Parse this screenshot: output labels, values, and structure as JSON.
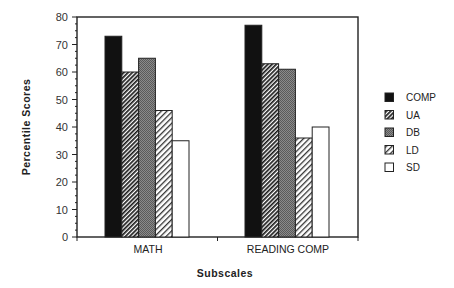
{
  "chart_data": {
    "type": "bar",
    "title": "",
    "xlabel": "Subscales",
    "ylabel": "Percentile Scores",
    "ylim": [
      0,
      80
    ],
    "yticks": [
      0,
      10,
      20,
      30,
      40,
      50,
      60,
      70,
      80
    ],
    "grid": false,
    "legend_position": "right",
    "categories": [
      "MATH",
      "READING COMP"
    ],
    "series": [
      {
        "name": "COMP",
        "values": [
          73,
          77
        ],
        "pattern": "solid-black"
      },
      {
        "name": "UA",
        "values": [
          60,
          63
        ],
        "pattern": "dense-diagonal-hatch"
      },
      {
        "name": "DB",
        "values": [
          65,
          61
        ],
        "pattern": "gray-stipple"
      },
      {
        "name": "LD",
        "values": [
          46,
          36
        ],
        "pattern": "light-diagonal-hatch"
      },
      {
        "name": "SD",
        "values": [
          35,
          40
        ],
        "pattern": "white"
      }
    ]
  },
  "colors": {
    "axis": "#222222",
    "comp": "#111111",
    "db": "#7a7a7a",
    "sd": "#ffffff"
  }
}
